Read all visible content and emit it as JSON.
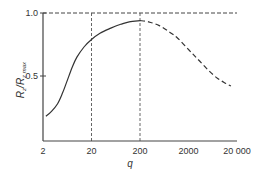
{
  "chart_data": {
    "type": "line",
    "title": "",
    "xlabel": "q",
    "ylabel": "R_z/R_z max",
    "xscale": "log",
    "xlim": [
      2,
      20000
    ],
    "ylim": [
      0,
      1.0
    ],
    "x_ticks": [
      2,
      20,
      200,
      2000,
      20000
    ],
    "x_tick_labels": [
      "2",
      "20",
      "200",
      "2000",
      "20 000"
    ],
    "y_ticks": [
      0.5,
      1.0
    ],
    "y_tick_labels": [
      "0.5",
      "1.0"
    ],
    "grid": false,
    "legend": null,
    "reference_lines": [
      {
        "type": "horizontal",
        "y": 1.0,
        "style": "dashed"
      },
      {
        "type": "vertical",
        "x": 20,
        "style": "dashed"
      },
      {
        "type": "vertical",
        "x": 200,
        "style": "dashed"
      }
    ],
    "series": [
      {
        "name": "measured",
        "style": "solid",
        "x": [
          2.3,
          3,
          4,
          5,
          6,
          8,
          10,
          14,
          20,
          30,
          50,
          80,
          120,
          200
        ],
        "y": [
          0.18,
          0.22,
          0.28,
          0.36,
          0.44,
          0.57,
          0.65,
          0.73,
          0.79,
          0.84,
          0.88,
          0.91,
          0.93,
          0.94
        ]
      },
      {
        "name": "extrapolated",
        "style": "dashed",
        "x": [
          200,
          300,
          500,
          800,
          1200,
          2000,
          3000,
          5000,
          8000,
          12000,
          15000
        ],
        "y": [
          0.94,
          0.93,
          0.9,
          0.85,
          0.8,
          0.71,
          0.64,
          0.55,
          0.48,
          0.44,
          0.42
        ]
      }
    ]
  },
  "labels": {
    "x_axis_title": "q",
    "y_axis_title_main": "R",
    "y_axis_title_sub1": "z",
    "y_axis_title_sep": "/R",
    "y_axis_title_sub2": "z max"
  }
}
